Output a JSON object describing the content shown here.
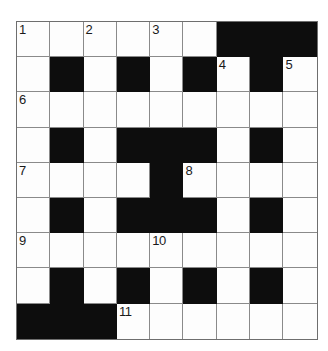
{
  "puzzle": {
    "title": "Crossword Grid",
    "rows": 9,
    "columns": 9,
    "colors": {
      "block": "#0d0d0d",
      "cell": "#fdfdfd",
      "gridline": "#8a8a8a",
      "number": "#1a1a1a",
      "background": "#ffffff"
    },
    "grid": [
      [
        {
          "type": "open",
          "number": "1"
        },
        {
          "type": "open",
          "number": ""
        },
        {
          "type": "open",
          "number": "2"
        },
        {
          "type": "open",
          "number": ""
        },
        {
          "type": "open",
          "number": "3"
        },
        {
          "type": "open",
          "number": ""
        },
        {
          "type": "block",
          "number": ""
        },
        {
          "type": "block",
          "number": ""
        },
        {
          "type": "block",
          "number": ""
        }
      ],
      [
        {
          "type": "open",
          "number": ""
        },
        {
          "type": "block",
          "number": ""
        },
        {
          "type": "open",
          "number": ""
        },
        {
          "type": "block",
          "number": ""
        },
        {
          "type": "open",
          "number": ""
        },
        {
          "type": "block",
          "number": ""
        },
        {
          "type": "open",
          "number": "4"
        },
        {
          "type": "block",
          "number": ""
        },
        {
          "type": "open",
          "number": "5"
        }
      ],
      [
        {
          "type": "open",
          "number": "6"
        },
        {
          "type": "open",
          "number": ""
        },
        {
          "type": "open",
          "number": ""
        },
        {
          "type": "open",
          "number": ""
        },
        {
          "type": "open",
          "number": ""
        },
        {
          "type": "open",
          "number": ""
        },
        {
          "type": "open",
          "number": ""
        },
        {
          "type": "open",
          "number": ""
        },
        {
          "type": "open",
          "number": ""
        }
      ],
      [
        {
          "type": "open",
          "number": ""
        },
        {
          "type": "block",
          "number": ""
        },
        {
          "type": "open",
          "number": ""
        },
        {
          "type": "block",
          "number": ""
        },
        {
          "type": "block",
          "number": ""
        },
        {
          "type": "block",
          "number": ""
        },
        {
          "type": "open",
          "number": ""
        },
        {
          "type": "block",
          "number": ""
        },
        {
          "type": "open",
          "number": ""
        }
      ],
      [
        {
          "type": "open",
          "number": "7"
        },
        {
          "type": "open",
          "number": ""
        },
        {
          "type": "open",
          "number": ""
        },
        {
          "type": "open",
          "number": ""
        },
        {
          "type": "block",
          "number": ""
        },
        {
          "type": "open",
          "number": "8"
        },
        {
          "type": "open",
          "number": ""
        },
        {
          "type": "open",
          "number": ""
        },
        {
          "type": "open",
          "number": ""
        }
      ],
      [
        {
          "type": "open",
          "number": ""
        },
        {
          "type": "block",
          "number": ""
        },
        {
          "type": "open",
          "number": ""
        },
        {
          "type": "block",
          "number": ""
        },
        {
          "type": "block",
          "number": ""
        },
        {
          "type": "block",
          "number": ""
        },
        {
          "type": "open",
          "number": ""
        },
        {
          "type": "block",
          "number": ""
        },
        {
          "type": "open",
          "number": ""
        }
      ],
      [
        {
          "type": "open",
          "number": "9"
        },
        {
          "type": "open",
          "number": ""
        },
        {
          "type": "open",
          "number": ""
        },
        {
          "type": "open",
          "number": ""
        },
        {
          "type": "open",
          "number": "10"
        },
        {
          "type": "open",
          "number": ""
        },
        {
          "type": "open",
          "number": ""
        },
        {
          "type": "open",
          "number": ""
        },
        {
          "type": "open",
          "number": ""
        }
      ],
      [
        {
          "type": "open",
          "number": ""
        },
        {
          "type": "block",
          "number": ""
        },
        {
          "type": "open",
          "number": ""
        },
        {
          "type": "block",
          "number": ""
        },
        {
          "type": "open",
          "number": ""
        },
        {
          "type": "block",
          "number": ""
        },
        {
          "type": "open",
          "number": ""
        },
        {
          "type": "block",
          "number": ""
        },
        {
          "type": "open",
          "number": ""
        }
      ],
      [
        {
          "type": "block",
          "number": ""
        },
        {
          "type": "block",
          "number": ""
        },
        {
          "type": "block",
          "number": ""
        },
        {
          "type": "open",
          "number": "11"
        },
        {
          "type": "open",
          "number": ""
        },
        {
          "type": "open",
          "number": ""
        },
        {
          "type": "open",
          "number": ""
        },
        {
          "type": "open",
          "number": ""
        },
        {
          "type": "open",
          "number": ""
        }
      ]
    ]
  }
}
